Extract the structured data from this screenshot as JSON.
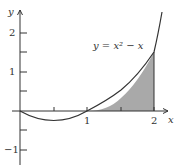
{
  "figure": {
    "equation_label": "y = x² − x",
    "x_axis_label": "x",
    "y_axis_label": "y",
    "x_ticks": [
      {
        "value": 0.5,
        "label": ""
      },
      {
        "value": 1,
        "label": "1"
      },
      {
        "value": 1.5,
        "label": ""
      },
      {
        "value": 2,
        "label": "2"
      }
    ],
    "y_ticks": [
      {
        "value": 2,
        "label": "2"
      },
      {
        "value": 1.5,
        "label": ""
      },
      {
        "value": 1,
        "label": "1"
      },
      {
        "value": 0.5,
        "label": ""
      },
      {
        "value": -0.5,
        "label": ""
      },
      {
        "value": -1,
        "label": "−1"
      }
    ],
    "shaded_region": {
      "from": 1,
      "to": 2,
      "description": "area under y = x² − x between x=1 and x=2"
    },
    "colors": {
      "curve": "#333333",
      "shade": "#a9a9a9",
      "axes": "#333333"
    }
  }
}
